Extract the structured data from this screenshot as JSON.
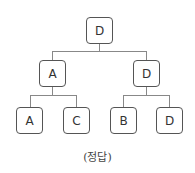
{
  "tree": {
    "root": {
      "label": "D"
    },
    "level1": [
      {
        "label": "A"
      },
      {
        "label": "D"
      }
    ],
    "level2": [
      {
        "label": "A"
      },
      {
        "label": "C"
      },
      {
        "label": "B"
      },
      {
        "label": "D"
      }
    ]
  },
  "caption": "(정답)"
}
